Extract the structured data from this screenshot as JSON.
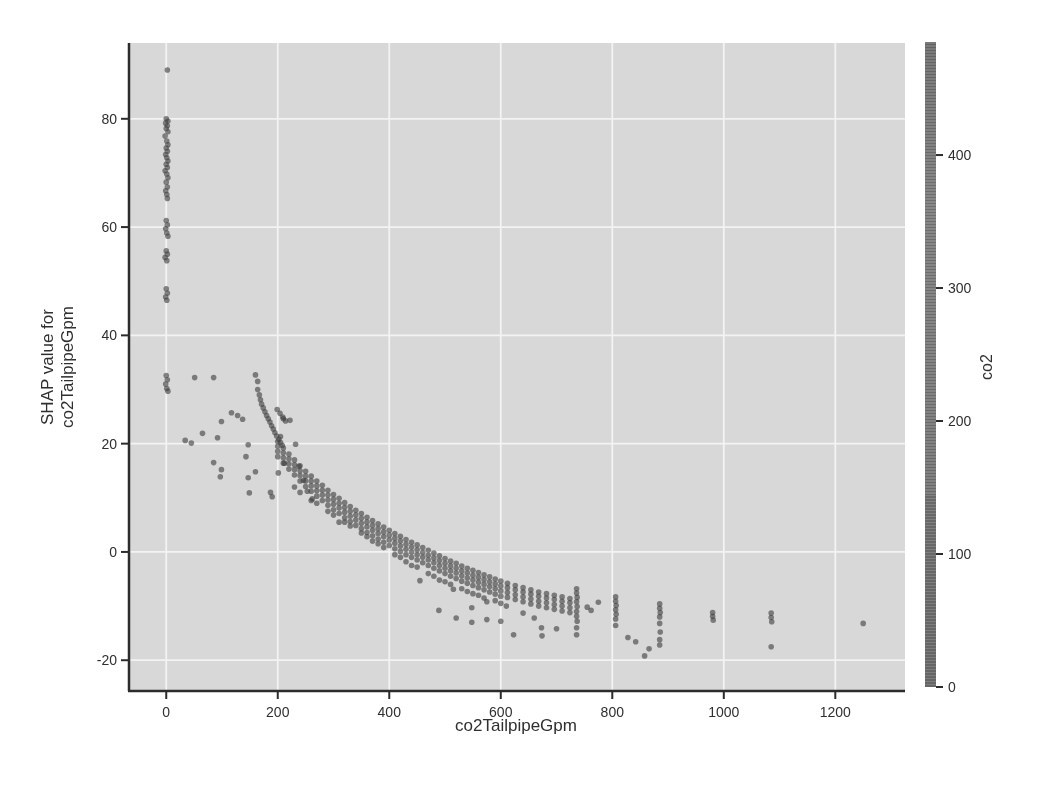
{
  "figure": {
    "xlabel": "co2TailpipeGpm",
    "ylabel_line1": "SHAP value for",
    "ylabel_line2": "co2TailpipeGpm",
    "colorbar_label": "co2"
  },
  "colors": {
    "page_bg": "#ffffff",
    "plot_bg": "#d8d8d8",
    "gridline": "#f3f3f3",
    "spine": "#2c2c2c",
    "text": "#2f2f2f",
    "point": "#3c3c3c",
    "colorbar_base": "#7b7b7b"
  },
  "chart_data": {
    "type": "scatter",
    "title": "",
    "xlabel": "co2TailpipeGpm",
    "ylabel": "SHAP value for co2TailpipeGpm",
    "grid": true,
    "x_ticks": [
      0,
      200,
      400,
      600,
      800,
      1000,
      1200
    ],
    "y_ticks": [
      -20,
      0,
      20,
      40,
      60,
      80
    ],
    "xlim": [
      -65,
      1325
    ],
    "ylim": [
      -25.5,
      94
    ],
    "colorbar": {
      "label": "co2",
      "ticks": [
        0,
        100,
        200,
        300,
        400
      ],
      "range": [
        0,
        485
      ]
    },
    "points": [
      [
        2,
        89
      ],
      [
        0,
        80
      ],
      [
        3,
        79.6
      ],
      [
        -1,
        79.2
      ],
      [
        2,
        78.7
      ],
      [
        0,
        78.2
      ],
      [
        3,
        77.6
      ],
      [
        -2,
        76.8
      ],
      [
        1,
        75.9
      ],
      [
        3,
        75.2
      ],
      [
        0,
        74.6
      ],
      [
        2,
        74
      ],
      [
        -1,
        73.4
      ],
      [
        1,
        72.8
      ],
      [
        3,
        72.2
      ],
      [
        0,
        71.6
      ],
      [
        2,
        71
      ],
      [
        -2,
        70.4
      ],
      [
        1,
        69.8
      ],
      [
        3,
        69.1
      ],
      [
        0,
        68.3
      ],
      [
        2,
        67.4
      ],
      [
        -1,
        66.7
      ],
      [
        1,
        66
      ],
      [
        2,
        65.3
      ],
      [
        0,
        61.2
      ],
      [
        2,
        60.4
      ],
      [
        -1,
        59.7
      ],
      [
        1,
        58.9
      ],
      [
        3,
        58.3
      ],
      [
        0,
        55.6
      ],
      [
        2,
        55
      ],
      [
        -2,
        54.4
      ],
      [
        1,
        53.8
      ],
      [
        0,
        48.6
      ],
      [
        2,
        47.8
      ],
      [
        -1,
        47.1
      ],
      [
        1,
        46.5
      ],
      [
        0,
        32.6
      ],
      [
        2,
        31.8
      ],
      [
        -1,
        31
      ],
      [
        1,
        30.2
      ],
      [
        3,
        29.7
      ],
      [
        51,
        32.2
      ],
      [
        85,
        32.2
      ],
      [
        34,
        20.6
      ],
      [
        45,
        20.1
      ],
      [
        65,
        21.9
      ],
      [
        92,
        21.1
      ],
      [
        99,
        24.1
      ],
      [
        117,
        25.7
      ],
      [
        128,
        25.2
      ],
      [
        137,
        24.5
      ],
      [
        85,
        16.5
      ],
      [
        99,
        15.2
      ],
      [
        97,
        13.9
      ],
      [
        147,
        19.8
      ],
      [
        143,
        17.6
      ],
      [
        147,
        13.7
      ],
      [
        149,
        10.9
      ],
      [
        160,
        14.8
      ],
      [
        205,
        21.3
      ],
      [
        210,
        24.6
      ],
      [
        222,
        24.3
      ],
      [
        201,
        14.6
      ],
      [
        187,
        11
      ],
      [
        190,
        10.2
      ],
      [
        232,
        19.9
      ],
      [
        238,
        15.8
      ],
      [
        246,
        13.2
      ],
      [
        253,
        11.2
      ],
      [
        262,
        9.8
      ],
      [
        212,
        16.4
      ],
      [
        160,
        32.7
      ],
      [
        164,
        31.5
      ],
      [
        164,
        30
      ],
      [
        167,
        29
      ],
      [
        169,
        28.1
      ],
      [
        171,
        27.3
      ],
      [
        174,
        26.6
      ],
      [
        177,
        25.9
      ],
      [
        180,
        25.2
      ],
      [
        183,
        24.6
      ],
      [
        186,
        24
      ],
      [
        189,
        23.3
      ],
      [
        192,
        22.7
      ],
      [
        195,
        22
      ],
      [
        198,
        21.4
      ],
      [
        202,
        20.8
      ],
      [
        205,
        20.2
      ],
      [
        208,
        19.7
      ],
      [
        199,
        26.3
      ],
      [
        204,
        25.6
      ],
      [
        209,
        24.9
      ],
      [
        214,
        24.2
      ],
      [
        200,
        20.4
      ],
      [
        200,
        19.5
      ],
      [
        200,
        18.6
      ],
      [
        200,
        17.6
      ],
      [
        210,
        19.2
      ],
      [
        210,
        18.3
      ],
      [
        210,
        17.4
      ],
      [
        210,
        16.4
      ],
      [
        220,
        18.1
      ],
      [
        220,
        17.2
      ],
      [
        220,
        16.3
      ],
      [
        220,
        15.3
      ],
      [
        230,
        17
      ],
      [
        230,
        16.1
      ],
      [
        230,
        15.2
      ],
      [
        230,
        14.2
      ],
      [
        240,
        15.9
      ],
      [
        240,
        15
      ],
      [
        240,
        14.1
      ],
      [
        240,
        13.1
      ],
      [
        250,
        14.9
      ],
      [
        250,
        14
      ],
      [
        250,
        13.1
      ],
      [
        250,
        12.1
      ],
      [
        260,
        14
      ],
      [
        260,
        13.1
      ],
      [
        260,
        12.2
      ],
      [
        260,
        11.2
      ],
      [
        270,
        13.1
      ],
      [
        270,
        12.2
      ],
      [
        270,
        11.3
      ],
      [
        270,
        10.3
      ],
      [
        280,
        12.3
      ],
      [
        280,
        11.4
      ],
      [
        280,
        10.5
      ],
      [
        280,
        9.5
      ],
      [
        290,
        11.4
      ],
      [
        290,
        10.5
      ],
      [
        290,
        9.6
      ],
      [
        290,
        8.6
      ],
      [
        300,
        10.6
      ],
      [
        300,
        9.7
      ],
      [
        300,
        8.8
      ],
      [
        300,
        7.8
      ],
      [
        310,
        9.9
      ],
      [
        310,
        9
      ],
      [
        310,
        8.1
      ],
      [
        310,
        7.1
      ],
      [
        320,
        9.1
      ],
      [
        320,
        8.2
      ],
      [
        320,
        7.3
      ],
      [
        320,
        6.3
      ],
      [
        330,
        8.4
      ],
      [
        330,
        7.5
      ],
      [
        330,
        6.6
      ],
      [
        330,
        5.6
      ],
      [
        340,
        7.7
      ],
      [
        340,
        6.8
      ],
      [
        340,
        5.9
      ],
      [
        340,
        4.9
      ],
      [
        350,
        7.1
      ],
      [
        350,
        6.2
      ],
      [
        350,
        5.3
      ],
      [
        350,
        4.3
      ],
      [
        360,
        6.4
      ],
      [
        360,
        5.5
      ],
      [
        360,
        4.6
      ],
      [
        360,
        3.6
      ],
      [
        370,
        5.8
      ],
      [
        370,
        4.9
      ],
      [
        370,
        4
      ],
      [
        370,
        3
      ],
      [
        380,
        5.2
      ],
      [
        380,
        4.3
      ],
      [
        380,
        3.4
      ],
      [
        380,
        2.4
      ],
      [
        390,
        4.6
      ],
      [
        390,
        3.7
      ],
      [
        390,
        2.8
      ],
      [
        390,
        1.8
      ],
      [
        400,
        4
      ],
      [
        400,
        3.1
      ],
      [
        400,
        2.2
      ],
      [
        400,
        1.2
      ],
      [
        410,
        3.4
      ],
      [
        410,
        2.5
      ],
      [
        410,
        1.6
      ],
      [
        410,
        0.6
      ],
      [
        420,
        2.9
      ],
      [
        420,
        2
      ],
      [
        420,
        1.1
      ],
      [
        420,
        0.1
      ],
      [
        430,
        2.3
      ],
      [
        430,
        1.4
      ],
      [
        430,
        0.5
      ],
      [
        430,
        -0.5
      ],
      [
        440,
        1.8
      ],
      [
        440,
        0.9
      ],
      [
        440,
        0
      ],
      [
        440,
        -1
      ],
      [
        450,
        1.3
      ],
      [
        450,
        0.4
      ],
      [
        450,
        -0.5
      ],
      [
        450,
        -1.5
      ],
      [
        460,
        0.8
      ],
      [
        460,
        -0.1
      ],
      [
        460,
        -1
      ],
      [
        460,
        -2
      ],
      [
        470,
        0.3
      ],
      [
        470,
        -0.6
      ],
      [
        470,
        -1.5
      ],
      [
        470,
        -2.5
      ],
      [
        480,
        -0.2
      ],
      [
        480,
        -1.1
      ],
      [
        480,
        -2
      ],
      [
        480,
        -3
      ],
      [
        490,
        -0.7
      ],
      [
        490,
        -1.6
      ],
      [
        490,
        -2.5
      ],
      [
        490,
        -3.5
      ],
      [
        500,
        -1.2
      ],
      [
        500,
        -2.1
      ],
      [
        500,
        -3
      ],
      [
        500,
        -4
      ],
      [
        510,
        -1.7
      ],
      [
        510,
        -2.6
      ],
      [
        510,
        -3.5
      ],
      [
        510,
        -4.5
      ],
      [
        520,
        -2.1
      ],
      [
        520,
        -3
      ],
      [
        520,
        -3.9
      ],
      [
        520,
        -4.9
      ],
      [
        530,
        -2.6
      ],
      [
        530,
        -3.5
      ],
      [
        530,
        -4.4
      ],
      [
        530,
        -5.4
      ],
      [
        540,
        -3
      ],
      [
        540,
        -3.9
      ],
      [
        540,
        -4.8
      ],
      [
        540,
        -5.8
      ],
      [
        550,
        -3.4
      ],
      [
        550,
        -4.3
      ],
      [
        550,
        -5.2
      ],
      [
        550,
        -6.2
      ],
      [
        560,
        -3.8
      ],
      [
        560,
        -4.7
      ],
      [
        560,
        -5.6
      ],
      [
        560,
        -6.6
      ],
      [
        570,
        -4.2
      ],
      [
        570,
        -5.1
      ],
      [
        570,
        -6
      ],
      [
        570,
        -7
      ],
      [
        580,
        -4.6
      ],
      [
        580,
        -5.5
      ],
      [
        580,
        -6.4
      ],
      [
        580,
        -7.4
      ],
      [
        590,
        -5
      ],
      [
        590,
        -5.9
      ],
      [
        590,
        -6.8
      ],
      [
        590,
        -7.8
      ],
      [
        600,
        -5.4
      ],
      [
        600,
        -6.3
      ],
      [
        600,
        -7.2
      ],
      [
        600,
        -8.2
      ],
      [
        230,
        12
      ],
      [
        260,
        9.5
      ],
      [
        290,
        7.5
      ],
      [
        320,
        5.5
      ],
      [
        350,
        3.5
      ],
      [
        380,
        1.5
      ],
      [
        410,
        -0.5
      ],
      [
        440,
        -2.5
      ],
      [
        470,
        -4
      ],
      [
        500,
        -5.5
      ],
      [
        530,
        -6.8
      ],
      [
        560,
        -8
      ],
      [
        590,
        -9
      ],
      [
        240,
        11
      ],
      [
        270,
        9
      ],
      [
        300,
        6.8
      ],
      [
        330,
        4.8
      ],
      [
        360,
        2.8
      ],
      [
        390,
        0.8
      ],
      [
        420,
        -1
      ],
      [
        450,
        -2.8
      ],
      [
        480,
        -4.5
      ],
      [
        510,
        -6
      ],
      [
        540,
        -7.3
      ],
      [
        570,
        -8.5
      ],
      [
        600,
        -9.5
      ],
      [
        310,
        5.5
      ],
      [
        370,
        2
      ],
      [
        430,
        -1.8
      ],
      [
        490,
        -5.2
      ],
      [
        550,
        -7.7
      ],
      [
        610,
        -10
      ],
      [
        455,
        -5.3
      ],
      [
        515,
        -6.9
      ],
      [
        575,
        -9.2
      ],
      [
        612,
        -5.8
      ],
      [
        612,
        -6.6
      ],
      [
        612,
        -7.5
      ],
      [
        612,
        -8.4
      ],
      [
        626,
        -6.2
      ],
      [
        626,
        -7
      ],
      [
        626,
        -7.9
      ],
      [
        626,
        -8.8
      ],
      [
        640,
        -6.6
      ],
      [
        640,
        -7.4
      ],
      [
        640,
        -8.3
      ],
      [
        640,
        -9.2
      ],
      [
        654,
        -7
      ],
      [
        654,
        -7.8
      ],
      [
        654,
        -8.7
      ],
      [
        654,
        -9.6
      ],
      [
        668,
        -7.4
      ],
      [
        668,
        -8.2
      ],
      [
        668,
        -9.1
      ],
      [
        668,
        -10
      ],
      [
        682,
        -7.7
      ],
      [
        682,
        -8.5
      ],
      [
        682,
        -9.4
      ],
      [
        682,
        -10.3
      ],
      [
        696,
        -8
      ],
      [
        696,
        -8.8
      ],
      [
        696,
        -9.7
      ],
      [
        696,
        -10.6
      ],
      [
        710,
        -8.3
      ],
      [
        710,
        -9.1
      ],
      [
        710,
        -10
      ],
      [
        710,
        -10.9
      ],
      [
        724,
        -8.6
      ],
      [
        724,
        -9.4
      ],
      [
        724,
        -10.3
      ],
      [
        724,
        -11.2
      ],
      [
        736,
        -6.8
      ],
      [
        736,
        -7.6
      ],
      [
        737,
        -8.4
      ],
      [
        736,
        -9.2
      ],
      [
        737,
        -10.1
      ],
      [
        736,
        -11
      ],
      [
        736,
        -11.9
      ],
      [
        737,
        -12.8
      ],
      [
        736,
        -14
      ],
      [
        736,
        -15.3
      ],
      [
        755,
        -10.2
      ],
      [
        762,
        -10.8
      ],
      [
        775,
        -9.3
      ],
      [
        806,
        -8.3
      ],
      [
        806,
        -9.1
      ],
      [
        807,
        -9.9
      ],
      [
        806,
        -10.7
      ],
      [
        807,
        -11.5
      ],
      [
        806,
        -12.4
      ],
      [
        806,
        -13.6
      ],
      [
        828,
        -15.8
      ],
      [
        842,
        -16.6
      ],
      [
        858,
        -19.2
      ],
      [
        866,
        -17.9
      ],
      [
        885,
        -9.6
      ],
      [
        885,
        -10.4
      ],
      [
        886,
        -11.2
      ],
      [
        885,
        -12
      ],
      [
        885,
        -13.2
      ],
      [
        886,
        -14.8
      ],
      [
        885,
        -16.2
      ],
      [
        885,
        -17.2
      ],
      [
        980,
        -11.2
      ],
      [
        980,
        -11.9
      ],
      [
        981,
        -12.6
      ],
      [
        1085,
        -11.3
      ],
      [
        1085,
        -12.1
      ],
      [
        1086,
        -12.9
      ],
      [
        1085,
        -17.5
      ],
      [
        1250,
        -13.2
      ],
      [
        489,
        -10.8
      ],
      [
        520,
        -12.2
      ],
      [
        548,
        -10.3
      ],
      [
        548,
        -13
      ],
      [
        575,
        -12.5
      ],
      [
        600,
        -12.8
      ],
      [
        623,
        -15.3
      ],
      [
        640,
        -11.3
      ],
      [
        660,
        -12.2
      ],
      [
        673,
        -14
      ],
      [
        674,
        -15.5
      ],
      [
        700,
        -14.2
      ]
    ]
  }
}
